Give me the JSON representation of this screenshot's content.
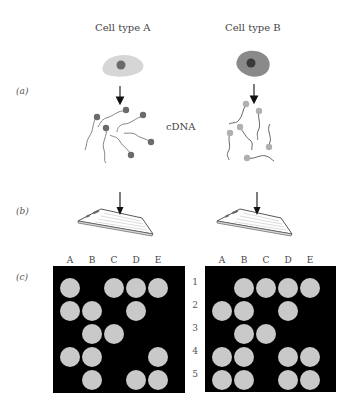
{
  "titles": {
    "cell_a": "Cell type A",
    "cell_b": "Cell type B"
  },
  "panel_labels": {
    "a": "(a)",
    "b": "(b)",
    "c": "(c)"
  },
  "cdna_label": "cDNA",
  "colors": {
    "cell_a_body": "#d6d6d6",
    "cell_a_nucleus": "#6b6b6b",
    "cell_b_body": "#8a8a8a",
    "cell_b_nucleus": "#3a3a3a",
    "cdna_a_tag": "#6b6b6b",
    "cdna_b_tag": "#b0b0b0",
    "array_bg": "#000000",
    "spot": "#c9c9c9"
  },
  "microarray": {
    "columns": [
      "A",
      "B",
      "C",
      "D",
      "E"
    ],
    "rows": [
      "1",
      "2",
      "3",
      "4",
      "5"
    ],
    "cell_type_a_spots": [
      [
        1,
        0,
        1,
        1,
        1
      ],
      [
        1,
        1,
        0,
        1,
        0
      ],
      [
        0,
        1,
        1,
        0,
        0
      ],
      [
        1,
        1,
        0,
        0,
        1
      ],
      [
        0,
        1,
        0,
        1,
        1
      ]
    ],
    "cell_type_b_spots": [
      [
        0,
        1,
        1,
        1,
        1
      ],
      [
        1,
        1,
        0,
        1,
        0
      ],
      [
        0,
        1,
        1,
        0,
        0
      ],
      [
        1,
        1,
        0,
        1,
        1
      ],
      [
        1,
        1,
        0,
        1,
        1
      ]
    ]
  }
}
